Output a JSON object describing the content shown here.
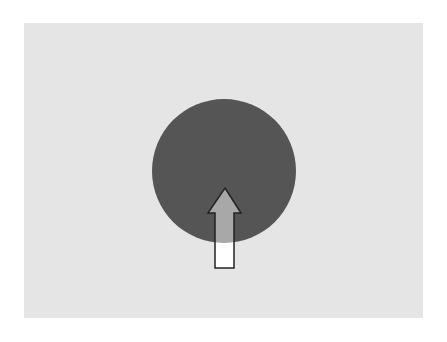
{
  "canvas": {
    "width": 447,
    "height": 342,
    "background": "#ffffff"
  },
  "panel": {
    "color": "#e5e5e5"
  },
  "circle": {
    "cx": 224,
    "cy": 171,
    "r": 72,
    "color": "#555555"
  },
  "arrow": {
    "direction": "up",
    "icon": "arrow-up-icon",
    "fill": "#ffffff",
    "fill_inside_circle": "#a8a8a8",
    "stroke": "#222222"
  }
}
